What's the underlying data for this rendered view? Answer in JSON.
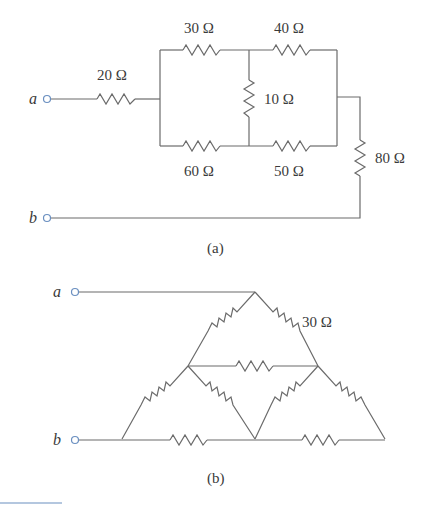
{
  "figure_a": {
    "caption": "(a)",
    "terminals": {
      "a": "a",
      "b": "b"
    },
    "resistors": {
      "r20": "20 Ω",
      "r30": "30 Ω",
      "r40": "40 Ω",
      "r10": "10 Ω",
      "r60": "60 Ω",
      "r50": "50 Ω",
      "r80": "80 Ω"
    }
  },
  "figure_b": {
    "caption": "(b)",
    "terminals": {
      "a": "a",
      "b": "b"
    },
    "resistors": {
      "r_top_right": "30 Ω"
    },
    "note": "All resistors in the triangular network are 30 Ω (one labeled)"
  },
  "colors": {
    "wire": "#6b6b6b",
    "terminal": "#6a8fc0",
    "text": "#3a3a3a"
  }
}
